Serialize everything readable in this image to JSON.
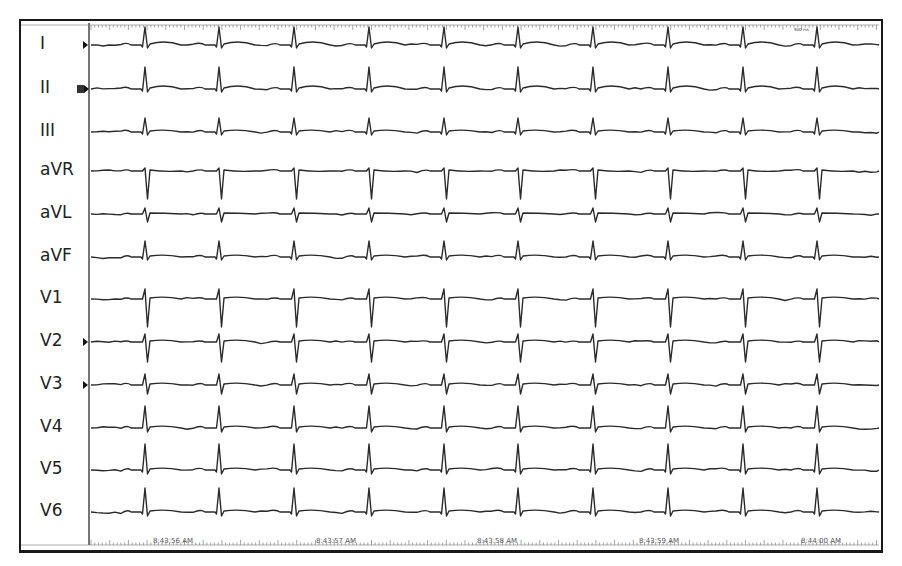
{
  "chart_data": {
    "type": "line",
    "xlabel": "Time",
    "ylabel": "",
    "grid": false,
    "legend": "none",
    "scale_marker": "500 ms",
    "time_ticks": [
      {
        "label": "8:43:56 AM",
        "x": 173
      },
      {
        "label": "8:43:57 AM",
        "x": 336
      },
      {
        "label": "8:43:58 AM",
        "x": 497
      },
      {
        "label": "8:43:59 AM",
        "x": 659
      },
      {
        "label": "8:44:00 AM",
        "x": 821
      }
    ],
    "beat_x": [
      145,
      219,
      294,
      369,
      444,
      518,
      593,
      668,
      743,
      817
    ],
    "heart_rate_bpm_estimate": 130,
    "leads": [
      {
        "name": "I",
        "y": 45,
        "r": 18,
        "s": 3,
        "q": 1,
        "t": 2,
        "marker": "arrow"
      },
      {
        "name": "II",
        "y": 89,
        "r": 22,
        "s": 3,
        "q": 1,
        "t": 2,
        "marker": "box"
      },
      {
        "name": "III",
        "y": 132,
        "r": 14,
        "s": 3,
        "q": 1,
        "t": 1,
        "marker": "none"
      },
      {
        "name": "aVR",
        "y": 171,
        "r": 3,
        "s": 28,
        "q": 0,
        "t": -1,
        "marker": "none"
      },
      {
        "name": "aVL",
        "y": 214,
        "r": 6,
        "s": 8,
        "q": 0,
        "t": 0,
        "marker": "none"
      },
      {
        "name": "aVF",
        "y": 257,
        "r": 16,
        "s": 3,
        "q": 1,
        "t": 1,
        "marker": "none"
      },
      {
        "name": "V1",
        "y": 299,
        "r": 10,
        "s": 28,
        "q": 0,
        "t": 1,
        "marker": "none"
      },
      {
        "name": "V2",
        "y": 342,
        "r": 8,
        "s": 20,
        "q": 0,
        "t": 1,
        "marker": "arrow"
      },
      {
        "name": "V3",
        "y": 385,
        "r": 11,
        "s": 9,
        "q": 0,
        "t": 1,
        "marker": "arrow"
      },
      {
        "name": "V4",
        "y": 428,
        "r": 22,
        "s": 4,
        "q": 0,
        "t": 1,
        "marker": "none"
      },
      {
        "name": "V5",
        "y": 470,
        "r": 26,
        "s": 4,
        "q": 1,
        "t": 1,
        "marker": "none"
      },
      {
        "name": "V6",
        "y": 512,
        "r": 24,
        "s": 4,
        "q": 1,
        "t": 1,
        "marker": "none"
      }
    ]
  },
  "colors": {
    "trace": "#2b2b2b",
    "frame": "#1a1a1a",
    "label": "#222222",
    "background": "#ffffff"
  }
}
